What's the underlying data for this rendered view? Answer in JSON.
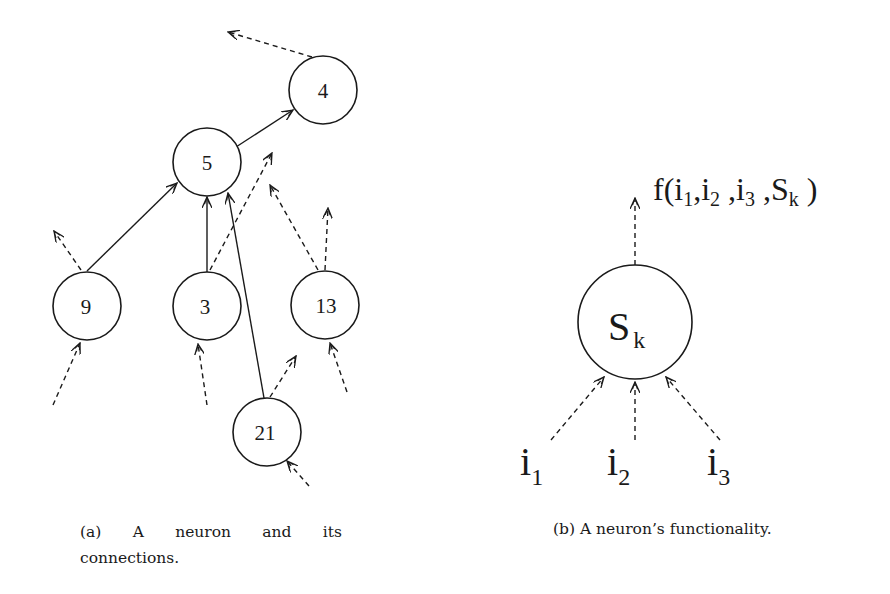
{
  "figure_a": {
    "nodes": [
      {
        "id": "4",
        "label": "4"
      },
      {
        "id": "5",
        "label": "5"
      },
      {
        "id": "9",
        "label": "9"
      },
      {
        "id": "3",
        "label": "3"
      },
      {
        "id": "13",
        "label": "13"
      },
      {
        "id": "21",
        "label": "21"
      }
    ],
    "caption": {
      "tag": "(a)",
      "w1": "A",
      "w2": "neuron",
      "w3": "and",
      "w4": "its",
      "line2": "connections."
    }
  },
  "figure_b": {
    "neuron_label": {
      "base": "S",
      "sub": "k"
    },
    "inputs": [
      {
        "base": "i",
        "sub": "1"
      },
      {
        "base": "i",
        "sub": "2"
      },
      {
        "base": "i",
        "sub": "3"
      }
    ],
    "output_formula": {
      "prefix": "f(i",
      "s1": "1",
      "p2": ",i",
      "s2": "2",
      "p3": " ,i",
      "s3": "3",
      "p4": " ,S",
      "s4": "k",
      "suffix": " )"
    },
    "caption": "(b) A neuron’s functionality."
  },
  "colors": {
    "ink": "#1a1a1a",
    "background": "#ffffff"
  }
}
